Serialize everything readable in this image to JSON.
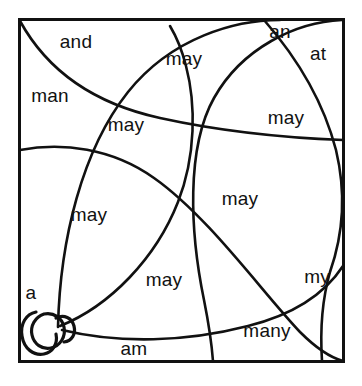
{
  "diagram": {
    "type": "line-art-region-map",
    "canvas": {
      "width": 362,
      "height": 386
    },
    "colors": {
      "background": "#ffffff",
      "stroke": "#111111",
      "text": "#111111"
    },
    "frame": {
      "name": "outer-rectangle",
      "x": 19,
      "y": 19,
      "width": 325,
      "height": 343
    },
    "labels": [
      {
        "id": "and",
        "text": "and",
        "x": 76,
        "y": 41
      },
      {
        "id": "an",
        "text": "an",
        "x": 280,
        "y": 31
      },
      {
        "id": "at",
        "text": "at",
        "x": 318,
        "y": 53
      },
      {
        "id": "man",
        "text": "man",
        "x": 50,
        "y": 95
      },
      {
        "id": "may1",
        "text": "may",
        "x": 184,
        "y": 58
      },
      {
        "id": "may2",
        "text": "may",
        "x": 126,
        "y": 124
      },
      {
        "id": "may3",
        "text": "may",
        "x": 286,
        "y": 117
      },
      {
        "id": "may4",
        "text": "may",
        "x": 240,
        "y": 198
      },
      {
        "id": "may5",
        "text": "may",
        "x": 89,
        "y": 214
      },
      {
        "id": "may6",
        "text": "may",
        "x": 164,
        "y": 279
      },
      {
        "id": "my",
        "text": "my",
        "x": 317,
        "y": 276
      },
      {
        "id": "many",
        "text": "many",
        "x": 267,
        "y": 330
      },
      {
        "id": "a",
        "text": "a",
        "x": 31,
        "y": 292
      },
      {
        "id": "am",
        "text": "am",
        "x": 134,
        "y": 348
      }
    ],
    "curves": [
      {
        "id": "curve-1",
        "note": "from top-left corner sweeping right and down to right edge"
      },
      {
        "id": "curve-2",
        "note": "from bottom-left knot arcing up and right to top edge"
      },
      {
        "id": "curve-3",
        "note": "from top-right corner sweeping left and down"
      },
      {
        "id": "curve-4",
        "note": "from top-right corner down along right side to bottom-right"
      },
      {
        "id": "curve-5",
        "note": "from left edge arcing right and down to bottom edge"
      },
      {
        "id": "curve-6",
        "note": "from bottom-left knot up and over to bottom-right corner"
      },
      {
        "id": "curve-7",
        "note": "from bottom-left knot arcing right along bottom"
      }
    ],
    "knot": {
      "id": "corner-knot",
      "note": "small looped knot where curves converge at lower-left",
      "x": 44,
      "y": 328
    }
  }
}
